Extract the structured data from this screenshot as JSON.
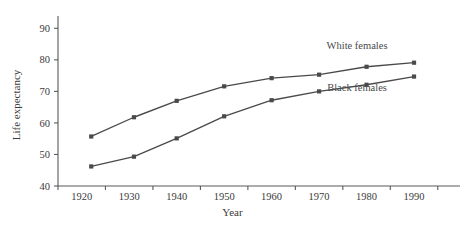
{
  "chart_data": {
    "type": "line",
    "title": "",
    "xlabel": "Year",
    "ylabel": "Life expectancy",
    "xlim": [
      1915,
      1998
    ],
    "ylim": [
      40,
      92
    ],
    "grid": false,
    "legend_position": "inline-right",
    "xticks": [
      1920,
      1930,
      1940,
      1950,
      1960,
      1970,
      1980,
      1990
    ],
    "xticklabels": [
      "1920",
      "1930",
      "1940",
      "1950",
      "1960",
      "1970",
      "1980",
      "1990"
    ],
    "yticks": [
      40,
      50,
      60,
      70,
      80,
      90
    ],
    "yticklabels": [
      "40",
      "50",
      "60",
      "70",
      "80",
      "90"
    ],
    "x": [
      1922,
      1931,
      1940,
      1950,
      1960,
      1970,
      1980,
      1990
    ],
    "series": [
      {
        "name": "White females",
        "color": "#4a4a4a",
        "marker": "square",
        "values": [
          55.7,
          61.8,
          67.0,
          71.6,
          74.2,
          75.3,
          77.8,
          79.1
        ],
        "annotation": "White females"
      },
      {
        "name": "Black females",
        "color": "#4a4a4a",
        "marker": "square",
        "values": [
          46.2,
          49.3,
          55.1,
          62.1,
          67.2,
          70.0,
          72.1,
          74.7
        ],
        "annotation": "Black females"
      }
    ],
    "annotations": [
      {
        "text": "White females",
        "x": 1978,
        "y": 83.5
      },
      {
        "text": "Black females",
        "x": 1978,
        "y": 70.0
      }
    ]
  },
  "colors": {
    "line": "#4a4a4a",
    "axis": "#5a5a5a",
    "text": "#3a3a3a",
    "background": "#ffffff"
  }
}
